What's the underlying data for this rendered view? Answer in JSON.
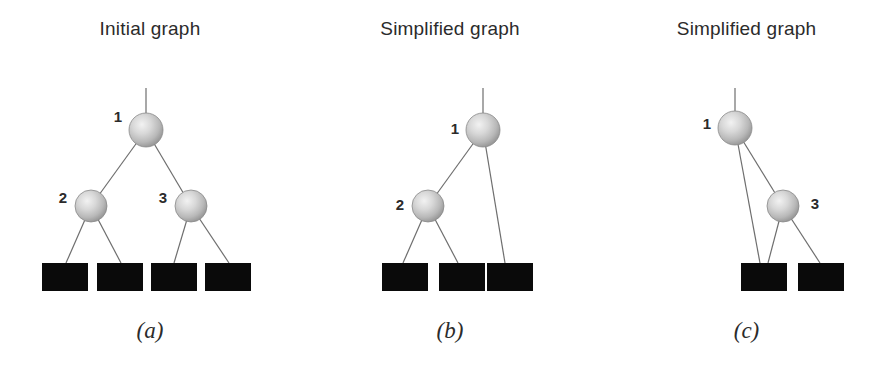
{
  "figure": {
    "width": 893,
    "height": 367,
    "background": "#ffffff",
    "ink_color": "#2b2b2b",
    "edge_color": "#6e6e6e",
    "leaf_fill": "#0a0a0a",
    "node_fill_light": "#f2f2f2",
    "node_fill_mid": "#b8b8b8",
    "node_fill_dark": "#8f8f8f"
  },
  "panels": [
    {
      "id": "a",
      "title": "Initial graph",
      "caption": "(a)",
      "left": 0,
      "width": 300,
      "root_stem": {
        "x": 146,
        "y_top": 88,
        "y_bottom": 113
      },
      "nodes": [
        {
          "id": "1",
          "label": "1",
          "cx": 146,
          "cy": 130,
          "r": 17,
          "label_x": 118,
          "label_y": 118
        },
        {
          "id": "2",
          "label": "2",
          "cx": 91,
          "cy": 206,
          "r": 16,
          "label_x": 63,
          "label_y": 199
        },
        {
          "id": "3",
          "label": "3",
          "cx": 191,
          "cy": 206,
          "r": 16,
          "label_x": 163,
          "label_y": 199
        }
      ],
      "leaves": [
        {
          "x": 42,
          "y": 263,
          "w": 46,
          "h": 28
        },
        {
          "x": 97,
          "y": 263,
          "w": 46,
          "h": 28
        },
        {
          "x": 151,
          "y": 263,
          "w": 46,
          "h": 28
        },
        {
          "x": 205,
          "y": 263,
          "w": 46,
          "h": 28
        }
      ],
      "edges": [
        {
          "from": "node:1",
          "to": "node:2",
          "x1": 146,
          "y1": 130,
          "x2": 91,
          "y2": 206
        },
        {
          "from": "node:1",
          "to": "node:3",
          "x1": 146,
          "y1": 130,
          "x2": 191,
          "y2": 206
        },
        {
          "from": "node:2",
          "to": "leaf:0",
          "x1": 91,
          "y1": 206,
          "x2": 66,
          "y2": 263
        },
        {
          "from": "node:2",
          "to": "leaf:1",
          "x1": 91,
          "y1": 206,
          "x2": 121,
          "y2": 263
        },
        {
          "from": "node:3",
          "to": "leaf:2",
          "x1": 191,
          "y1": 206,
          "x2": 174,
          "y2": 263
        },
        {
          "from": "node:3",
          "to": "leaf:3",
          "x1": 191,
          "y1": 206,
          "x2": 229,
          "y2": 263
        }
      ]
    },
    {
      "id": "b",
      "title": "Simplified graph",
      "caption": "(b)",
      "left": 300,
      "width": 300,
      "root_stem": {
        "x": 183,
        "y_top": 88,
        "y_bottom": 113
      },
      "nodes": [
        {
          "id": "1",
          "label": "1",
          "cx": 183,
          "cy": 130,
          "r": 17,
          "label_x": 155,
          "label_y": 130
        },
        {
          "id": "2",
          "label": "2",
          "cx": 128,
          "cy": 206,
          "r": 16,
          "label_x": 100,
          "label_y": 206
        }
      ],
      "leaves": [
        {
          "x": 82,
          "y": 263,
          "w": 46,
          "h": 28
        },
        {
          "x": 139,
          "y": 263,
          "w": 46,
          "h": 28
        },
        {
          "x": 187,
          "y": 263,
          "w": 46,
          "h": 28
        }
      ],
      "edges": [
        {
          "from": "node:1",
          "to": "node:2",
          "x1": 183,
          "y1": 130,
          "x2": 128,
          "y2": 206
        },
        {
          "from": "node:1",
          "to": "leaf:2",
          "x1": 183,
          "y1": 130,
          "x2": 205,
          "y2": 263
        },
        {
          "from": "node:2",
          "to": "leaf:0",
          "x1": 128,
          "y1": 206,
          "x2": 103,
          "y2": 263
        },
        {
          "from": "node:2",
          "to": "leaf:1",
          "x1": 128,
          "y1": 206,
          "x2": 158,
          "y2": 263
        }
      ]
    },
    {
      "id": "c",
      "title": "Simplified graph",
      "caption": "(c)",
      "left": 600,
      "width": 293,
      "root_stem": {
        "x": 135,
        "y_top": 88,
        "y_bottom": 111
      },
      "nodes": [
        {
          "id": "1",
          "label": "1",
          "cx": 135,
          "cy": 128,
          "r": 17,
          "label_x": 107,
          "label_y": 125
        },
        {
          "id": "3",
          "label": "3",
          "cx": 183,
          "cy": 206,
          "r": 16,
          "label_x": 215,
          "label_y": 205
        }
      ],
      "leaves": [
        {
          "x": 141,
          "y": 263,
          "w": 46,
          "h": 28
        },
        {
          "x": 198,
          "y": 263,
          "w": 46,
          "h": 28
        }
      ],
      "edges": [
        {
          "from": "node:1",
          "to": "leaf:0",
          "x1": 135,
          "y1": 128,
          "x2": 160,
          "y2": 263
        },
        {
          "from": "node:1",
          "to": "node:3",
          "x1": 135,
          "y1": 128,
          "x2": 183,
          "y2": 206
        },
        {
          "from": "node:3",
          "to": "leaf:0",
          "x1": 183,
          "y1": 206,
          "x2": 168,
          "y2": 263
        },
        {
          "from": "node:3",
          "to": "leaf:1",
          "x1": 183,
          "y1": 206,
          "x2": 220,
          "y2": 263
        }
      ]
    }
  ]
}
